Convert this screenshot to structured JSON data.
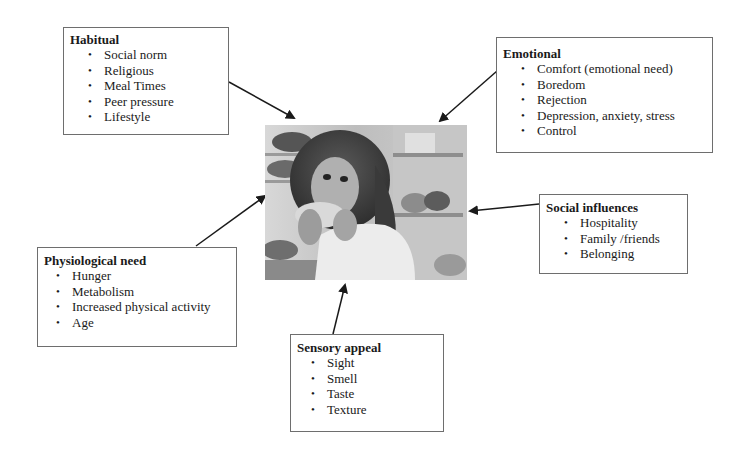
{
  "diagram": {
    "center": {
      "label": "Woman eating from open refrigerator (photo)"
    },
    "boxes": [
      {
        "id": "habitual",
        "title": "Habitual",
        "items": [
          "Social norm",
          "Religious",
          "Meal Times",
          "Peer pressure",
          "Lifestyle"
        ]
      },
      {
        "id": "emotional",
        "title": "Emotional",
        "items": [
          "Comfort (emotional need)",
          "Boredom",
          "Rejection",
          "Depression, anxiety, stress",
          "Control"
        ]
      },
      {
        "id": "social",
        "title": "Social influences",
        "items": [
          "Hospitality",
          "Family /friends",
          "Belonging"
        ]
      },
      {
        "id": "physiological",
        "title": "Physiological need",
        "items": [
          "Hunger",
          "Metabolism",
          "Increased physical activity",
          "Age"
        ]
      },
      {
        "id": "sensory",
        "title": "Sensory appeal",
        "items": [
          "Sight",
          "Smell",
          "Taste",
          "Texture"
        ]
      }
    ],
    "colors": {
      "border": "#6e6e6e",
      "arrow": "#1a1a1a",
      "text": "#1a1a1a"
    }
  }
}
